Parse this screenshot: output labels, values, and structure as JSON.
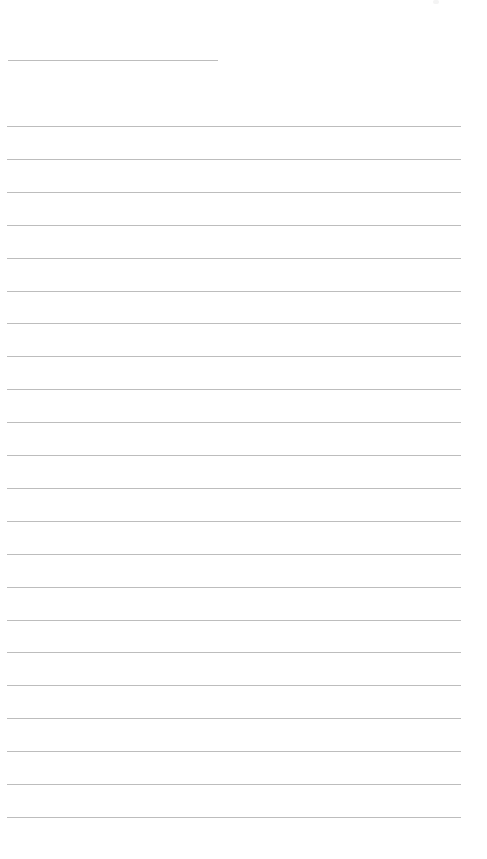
{
  "page": {
    "type": "lined-paper",
    "background_color": "#ffffff",
    "rule_color": "#bdbdbd",
    "title_line": {
      "label": "",
      "x": 8,
      "y": 60,
      "width": 210
    },
    "writing_lines": {
      "count": 22,
      "start_y": 126,
      "spacing": 32.9,
      "x": 7,
      "width": 454,
      "values": [
        "",
        "",
        "",
        "",
        "",
        "",
        "",
        "",
        "",
        "",
        "",
        "",
        "",
        "",
        "",
        "",
        "",
        "",
        "",
        "",
        "",
        ""
      ]
    }
  }
}
